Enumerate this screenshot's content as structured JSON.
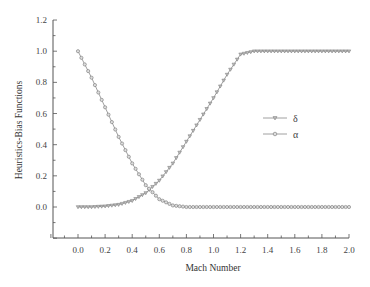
{
  "chart_data": {
    "type": "line",
    "title": "",
    "xlabel": "Mach Number",
    "ylabel": "Heuristics-Bias Functions",
    "xlim": [
      -0.3,
      2.0
    ],
    "ylim": [
      -0.2,
      1.2
    ],
    "xticks": [
      "0.0",
      "0.2",
      "0.4",
      "0.6",
      "0.8",
      "1.0",
      "1.2",
      "1.4",
      "1.6",
      "1.8",
      "2.0"
    ],
    "yticks": [
      "0.0",
      "0.2",
      "0.4",
      "0.6",
      "0.8",
      "1.0",
      "1.2"
    ],
    "grid": false,
    "legend_position": "center-right",
    "series": [
      {
        "name": "δ",
        "marker": "triangle-down",
        "color": "#777777",
        "x": [
          0.0,
          0.1,
          0.2,
          0.3,
          0.4,
          0.5,
          0.6,
          0.7,
          0.8,
          0.9,
          1.0,
          1.1,
          1.2,
          1.3,
          1.4,
          1.5,
          1.6,
          1.7,
          1.8,
          1.9,
          2.0
        ],
        "values": [
          0.0,
          0.0,
          0.005,
          0.015,
          0.04,
          0.09,
          0.17,
          0.28,
          0.42,
          0.56,
          0.7,
          0.85,
          0.98,
          1.0,
          1.0,
          1.0,
          1.0,
          1.0,
          1.0,
          1.0,
          1.0
        ]
      },
      {
        "name": "α",
        "marker": "circle",
        "color": "#777777",
        "x": [
          0.0,
          0.1,
          0.2,
          0.3,
          0.4,
          0.5,
          0.6,
          0.7,
          0.8,
          0.9,
          1.0,
          1.2,
          1.4,
          1.6,
          1.8,
          2.0
        ],
        "values": [
          1.0,
          0.83,
          0.64,
          0.45,
          0.28,
          0.14,
          0.05,
          0.01,
          0.0,
          0.0,
          0.0,
          0.0,
          0.0,
          0.0,
          0.0,
          0.0
        ]
      }
    ]
  }
}
